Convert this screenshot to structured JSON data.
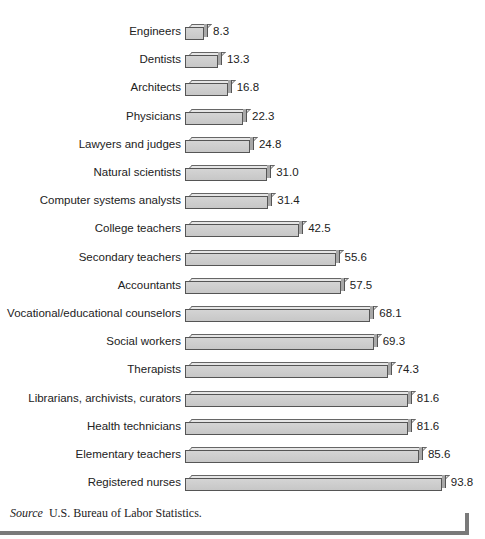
{
  "chart_data": {
    "type": "bar",
    "orientation": "horizontal",
    "title": "",
    "xlabel": "",
    "ylabel": "",
    "grid": false,
    "legend": null,
    "categories": [
      "Engineers",
      "Dentists",
      "Architects",
      "Physicians",
      "Lawyers and judges",
      "Natural scientists",
      "Computer systems analysts",
      "College teachers",
      "Secondary teachers",
      "Accountants",
      "Vocational/educational counselors",
      "Social workers",
      "Therapists",
      "Librarians, archivists, curators",
      "Health technicians",
      "Elementary teachers",
      "Registered nurses"
    ],
    "values": [
      8.3,
      13.3,
      16.8,
      22.3,
      24.8,
      31.0,
      31.4,
      42.5,
      55.6,
      57.5,
      68.1,
      69.3,
      74.3,
      81.6,
      81.6,
      85.6,
      93.8
    ],
    "value_labels": [
      "8.3",
      "13.3",
      "16.8",
      "22.3",
      "24.8",
      "31.0",
      "31.4",
      "42.5",
      "55.6",
      "57.5",
      "68.1",
      "69.3",
      "74.3",
      "81.6",
      "81.6",
      "85.6",
      "93.8"
    ],
    "xlim": [
      0,
      100
    ],
    "bar_color": "#cccccc"
  },
  "source": {
    "prefix": "Source",
    "text": "U.S. Bureau of Labor Statistics."
  }
}
